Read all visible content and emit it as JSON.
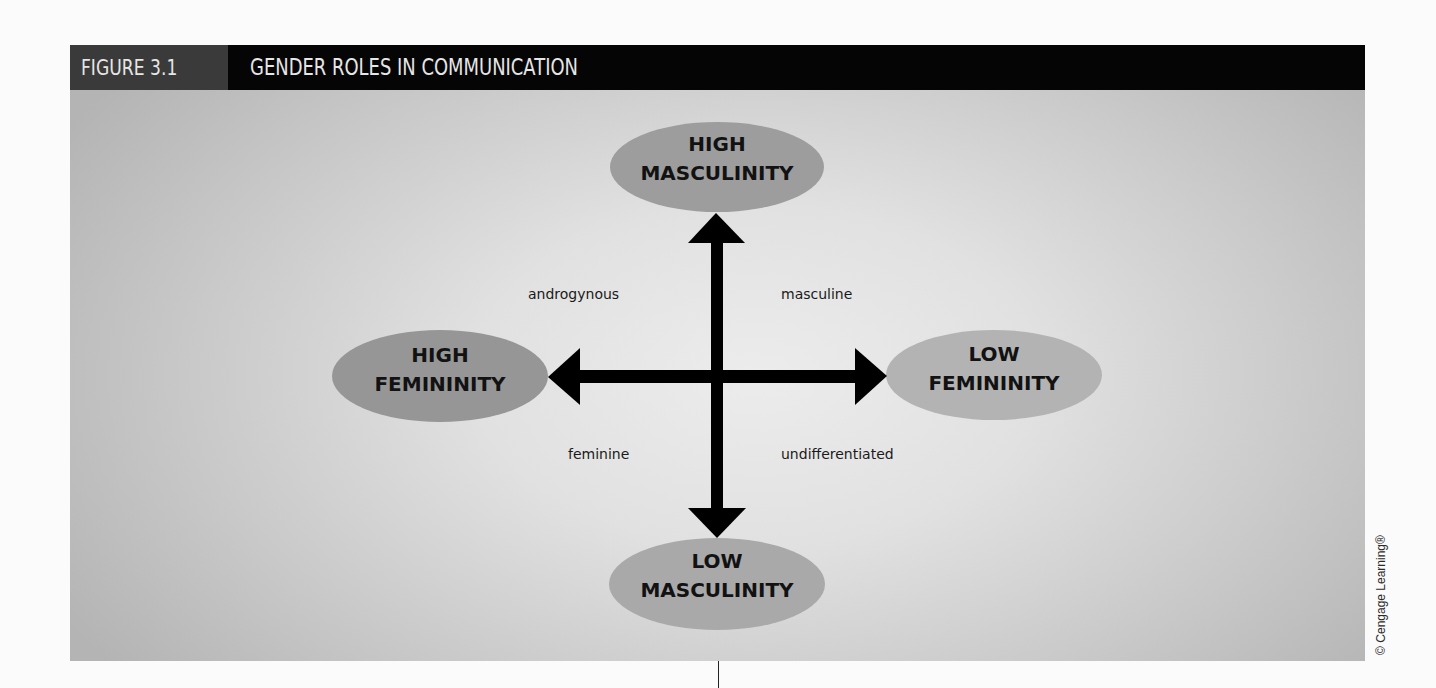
{
  "figure": {
    "number": "FIGURE 3.1",
    "title": "GENDER ROLES IN COMMUNICATION",
    "colors": {
      "header_bar": "#050505",
      "number_box": "#3a3a3a",
      "header_text": "#e6e6e6",
      "panel_center": "#ececec",
      "panel_edge": "#b4b4b4",
      "ellipse_dark": "#9a9a9a",
      "ellipse_light": "#b3b3b3",
      "arrows": "#000000"
    }
  },
  "diagram": {
    "nodes": {
      "top": {
        "line1": "HIGH",
        "line2": "MASCULINITY"
      },
      "bottom": {
        "line1": "LOW",
        "line2": "MASCULINITY"
      },
      "left": {
        "line1": "HIGH",
        "line2": "FEMININITY"
      },
      "right": {
        "line1": "LOW",
        "line2": "FEMININITY"
      }
    },
    "quadrants": {
      "top_left": "androgynous",
      "top_right": "masculine",
      "bottom_left": "feminine",
      "bottom_right": "undifferentiated"
    },
    "axes": {
      "vertical": {
        "positive_end": "HIGH MASCULINITY",
        "negative_end": "LOW MASCULINITY"
      },
      "horizontal": {
        "left_end": "HIGH FEMININITY",
        "right_end": "LOW FEMININITY"
      }
    }
  },
  "credit": "© Cengage Learning®"
}
